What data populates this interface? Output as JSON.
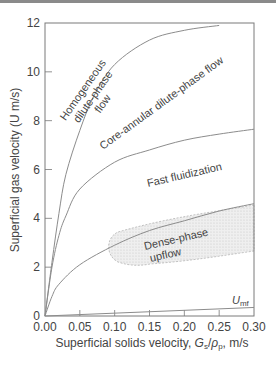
{
  "chart_data": {
    "type": "line",
    "title": "",
    "xlabel": "Superficial solids velocity, Gs/ρp, m/s",
    "xlabel_parts": {
      "prefix": "Superficial solids velocity, ",
      "g": "G",
      "g_sub": "s",
      "slash": "/",
      "rho": "ρ",
      "rho_sub": "p",
      "suffix": ", m/s"
    },
    "ylabel": "Superficial gas velocity (U m/s)",
    "xlim": [
      0,
      0.3
    ],
    "ylim": [
      0,
      12
    ],
    "x_ticks": [
      "0.00",
      "0.05",
      "0.10",
      "0.15",
      "0.20",
      "0.25",
      "0.30"
    ],
    "y_ticks": [
      "0",
      "2",
      "4",
      "6",
      "8",
      "10",
      "12"
    ],
    "grid": false,
    "series": [
      {
        "name": "Homogeneous dilute-phase / core-annular boundary",
        "x": [
          0,
          0.01,
          0.02,
          0.03,
          0.05,
          0.07,
          0.1,
          0.15,
          0.2,
          0.25
        ],
        "y": [
          0,
          2.2,
          4.2,
          5.8,
          7.6,
          9.0,
          10.3,
          11.3,
          11.7,
          11.9
        ]
      },
      {
        "name": "Core-annular / fast fluidization boundary",
        "x": [
          0,
          0.01,
          0.02,
          0.03,
          0.05,
          0.1,
          0.15,
          0.2,
          0.25,
          0.3
        ],
        "y": [
          0,
          2.0,
          3.3,
          4.1,
          5.2,
          6.3,
          6.8,
          7.2,
          7.45,
          7.65
        ]
      },
      {
        "name": "Fast fluidization / dense-phase boundary",
        "x": [
          0,
          0.01,
          0.02,
          0.05,
          0.1,
          0.15,
          0.2,
          0.25,
          0.3
        ],
        "y": [
          0,
          0.8,
          1.3,
          2.1,
          2.9,
          3.5,
          3.9,
          4.3,
          4.6
        ]
      },
      {
        "name": "Umf",
        "x": [
          0,
          0.3
        ],
        "y": [
          0,
          0.35
        ]
      }
    ],
    "shaded_region": {
      "name": "Dense-phase upflow",
      "approx_bounds": {
        "x": [
          0.09,
          0.3
        ],
        "y_top": [
          3.0,
          4.5
        ],
        "y_bottom": [
          1.1,
          2.6
        ]
      }
    },
    "annotations": [
      {
        "text": [
          "Homogeneous",
          "dilute-phase",
          "flow"
        ]
      },
      {
        "text": "Core-annular dilute-phase flow"
      },
      {
        "text": "Fast fluidization"
      },
      {
        "text": [
          "Dense-phase",
          "upflow"
        ]
      },
      {
        "text": "U",
        "sub": "mf"
      }
    ]
  },
  "colors": {
    "curve": "#8c8c8c",
    "axis": "#777777",
    "shade": "#e6e6e6",
    "text": "#444444"
  }
}
